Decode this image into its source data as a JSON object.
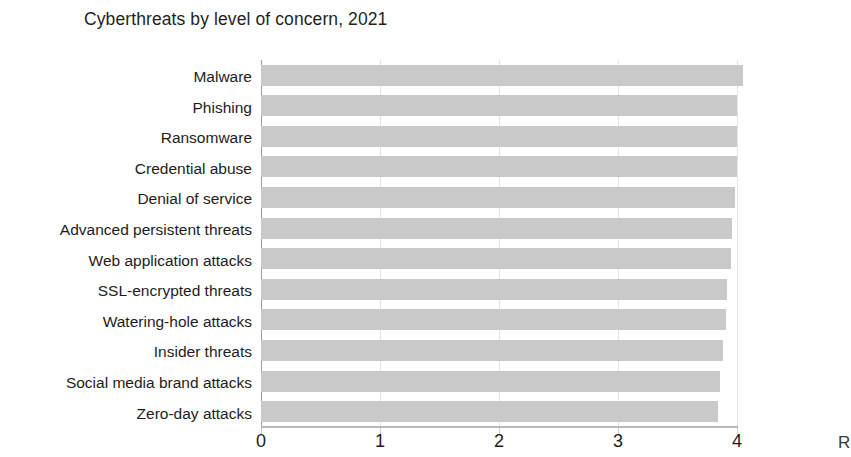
{
  "chart_data": {
    "type": "bar",
    "orientation": "horizontal",
    "title": "Cyberthreats by level of concern, 2021",
    "xlabel": "",
    "ylabel": "",
    "xlim": [
      0,
      4.15
    ],
    "xticks": [
      "0",
      "1",
      "2",
      "3",
      "4"
    ],
    "xtick_values": [
      0,
      1,
      2,
      3,
      4
    ],
    "grid": true,
    "grid_axis": "x",
    "legend": false,
    "bar_color": "#c9c9c9",
    "categories": [
      "Malware",
      "Phishing",
      "Ransomware",
      "Credential abuse",
      "Denial of service",
      "Advanced persistent threats",
      "Web application attacks",
      "SSL-encrypted threats",
      "Watering-hole attacks",
      "Insider threats",
      "Social media brand attacks",
      "Zero-day attacks"
    ],
    "values": [
      4.05,
      4.0,
      4.0,
      4.0,
      3.98,
      3.96,
      3.95,
      3.92,
      3.91,
      3.88,
      3.86,
      3.84
    ]
  },
  "figure": {
    "title": "Cyberthreats by level of concern, 2021",
    "caption_fragment": "R"
  }
}
